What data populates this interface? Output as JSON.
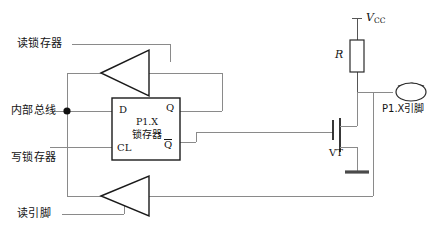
{
  "diagram": {
    "colors": {
      "wire": "#8a8a8a",
      "symbol_outline": "#1a1a1a",
      "background": "#ffffff",
      "node": "#111111",
      "ground": "#4a4a4a"
    },
    "labels": {
      "read_latch": "读锁存器",
      "internal_bus": "内部总线",
      "write_latch": "写锁存器",
      "read_pin": "读引脚",
      "pin_name": "P1.X引脚",
      "vcc_symbol": "V",
      "vcc_subscript": "CC",
      "resistor": "R",
      "transistor": "VT"
    },
    "latch": {
      "input_d": "D",
      "input_cl": "CL",
      "output_q": "Q",
      "output_qbar": "Q",
      "name_id": "P1.X",
      "name_cn": "锁存器"
    },
    "buffers": [
      {
        "name": "read-latch-buffer",
        "direction": "left"
      },
      {
        "name": "read-pin-buffer",
        "direction": "left"
      }
    ]
  }
}
